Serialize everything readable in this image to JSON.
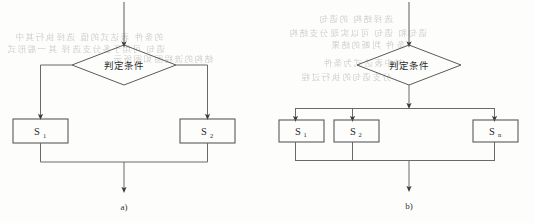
{
  "figure": {
    "background_color": "#fdfdfc",
    "stroke_color": "#555555",
    "text_color": "#2b2b2b",
    "ghost_text_color": "#c9c9c7"
  },
  "diagrams": [
    {
      "id": "a",
      "caption": "a)",
      "decision": {
        "label": "判定条件",
        "shape": "diamond"
      },
      "branches": [
        {
          "label": "S",
          "subscript": "1",
          "full": "S₁"
        },
        {
          "label": "S",
          "subscript": "2",
          "full": "S₂"
        }
      ],
      "entry_arrow": true,
      "exit_arrow": true
    },
    {
      "id": "b",
      "caption": "b)",
      "decision": {
        "label": "判定条件",
        "shape": "diamond"
      },
      "branches": [
        {
          "label": "S",
          "subscript": "1",
          "full": "S₁"
        },
        {
          "label": "S",
          "subscript": "2",
          "full": "S₂"
        },
        {
          "label": "S",
          "subscript": "n",
          "full": "Sₙ"
        }
      ],
      "entry_arrow": true,
      "exit_arrow": true
    }
  ],
  "ghost_marks": [
    {
      "x": 14,
      "y": 30,
      "text": "的条件 表达式的值 选择执行其中"
    },
    {
      "x": 6,
      "y": 42,
      "text": "语句 可用于多分支选择 其一般形式"
    },
    {
      "x": 112,
      "y": 52,
      "text": "结构的流程图如图所示"
    },
    {
      "x": 318,
      "y": 12,
      "text": "选择结构 的语句"
    },
    {
      "x": 288,
      "y": 26,
      "text": "语句和 语句 可以实现分支结构"
    },
    {
      "x": 330,
      "y": 38,
      "text": "条件 判断的结果"
    },
    {
      "x": 322,
      "y": 56,
      "text": "其中表达式为条件"
    },
    {
      "x": 300,
      "y": 70,
      "text": "分支语句的执行过程"
    }
  ]
}
